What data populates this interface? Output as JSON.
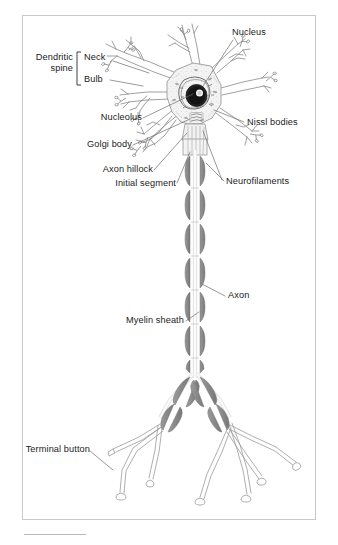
{
  "figure": {
    "kind": "anatomical-diagram",
    "background_color": "#ffffff",
    "frame_border_color": "#c9c9c9",
    "ink_color": "#7d7d7d",
    "text_color": "#1b1b1b",
    "myelin_fill": "#8a8a8a",
    "nucleus_fill": "#1f1f1f",
    "nucleolus_fill": "#f2f2f2",
    "soma_fill": "#f0f0f0"
  },
  "labels": {
    "nucleus": "Nucleus",
    "dendritic_spine": "Dendritic\nspine",
    "dendritic_spine_line1": "Dendritic",
    "dendritic_spine_line2": "spine",
    "neck": "Neck",
    "bulb": "Bulb",
    "nucleolus": "Nucleolus",
    "nissl_bodies": "Nissl bodies",
    "golgi_body": "Golgi body",
    "axon_hillock": "Axon hillock",
    "initial_segment": "Initial segment",
    "neurofilaments": "Neurofilaments",
    "axon": "Axon",
    "myelin_sheath": "Myelin sheath",
    "terminal_button": "Terminal button"
  },
  "structures": [
    {
      "name": "soma",
      "label": "cell body"
    },
    {
      "name": "nucleus",
      "label": "Nucleus"
    },
    {
      "name": "nucleolus",
      "label": "Nucleolus"
    },
    {
      "name": "dendrites",
      "label": "dendrites"
    },
    {
      "name": "dendritic-spine-neck",
      "label": "Neck"
    },
    {
      "name": "dendritic-spine-bulb",
      "label": "Bulb"
    },
    {
      "name": "nissl-bodies",
      "label": "Nissl bodies"
    },
    {
      "name": "golgi-body",
      "label": "Golgi body"
    },
    {
      "name": "axon-hillock",
      "label": "Axon hillock"
    },
    {
      "name": "initial-segment",
      "label": "Initial segment"
    },
    {
      "name": "neurofilaments",
      "label": "Neurofilaments"
    },
    {
      "name": "axon",
      "label": "Axon"
    },
    {
      "name": "myelin-sheath",
      "label": "Myelin sheath"
    },
    {
      "name": "terminal-button",
      "label": "Terminal button"
    }
  ]
}
